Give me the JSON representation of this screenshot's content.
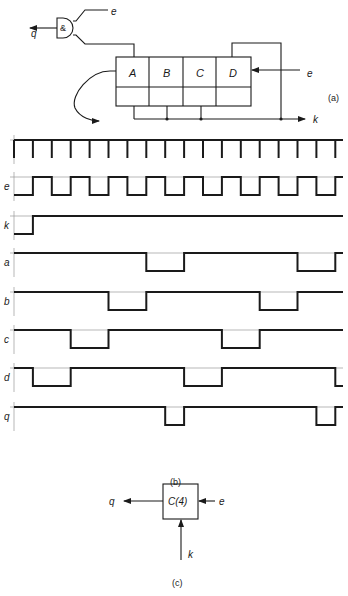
{
  "figure": {
    "panel_a": {
      "caption": "(a)",
      "gate_label": "&",
      "gate_output_label": "q",
      "gate_input_label": "e",
      "register_cells": [
        "A",
        "B",
        "C",
        "D"
      ],
      "clock_input_label": "e",
      "output_k_label": "k"
    },
    "panel_b": {
      "caption": "(b)",
      "num_clock_ticks": 18,
      "signals": [
        {
          "name": "clock",
          "label": "",
          "kind": "ticks"
        },
        {
          "name": "e",
          "label": "e",
          "transitions": [
            [
              0,
              0
            ],
            [
              1,
              1
            ],
            [
              2,
              0
            ],
            [
              3,
              1
            ],
            [
              4,
              0
            ],
            [
              5,
              1
            ],
            [
              6,
              0
            ],
            [
              7,
              1
            ],
            [
              8,
              0
            ],
            [
              9,
              1
            ],
            [
              10,
              0
            ],
            [
              11,
              1
            ],
            [
              12,
              0
            ],
            [
              13,
              1
            ],
            [
              14,
              0
            ],
            [
              15,
              1
            ],
            [
              16,
              0
            ],
            [
              17,
              1
            ]
          ]
        },
        {
          "name": "k",
          "label": "k",
          "transitions": [
            [
              0,
              0
            ],
            [
              1,
              1
            ]
          ]
        },
        {
          "name": "a",
          "label": "a",
          "transitions": [
            [
              0,
              1
            ],
            [
              7,
              0
            ],
            [
              9,
              1
            ],
            [
              15,
              0
            ],
            [
              17,
              1
            ]
          ]
        },
        {
          "name": "b",
          "label": "b",
          "transitions": [
            [
              0,
              1
            ],
            [
              5,
              0
            ],
            [
              7,
              1
            ],
            [
              13,
              0
            ],
            [
              15,
              1
            ]
          ]
        },
        {
          "name": "c",
          "label": "c",
          "transitions": [
            [
              0,
              1
            ],
            [
              3,
              0
            ],
            [
              5,
              1
            ],
            [
              11,
              0
            ],
            [
              13,
              1
            ]
          ]
        },
        {
          "name": "d",
          "label": "d",
          "transitions": [
            [
              0,
              1
            ],
            [
              1,
              0
            ],
            [
              3,
              1
            ],
            [
              9,
              0
            ],
            [
              11,
              1
            ],
            [
              17,
              0
            ]
          ]
        },
        {
          "name": "q",
          "label": "q",
          "transitions": [
            [
              0,
              1
            ],
            [
              8,
              0
            ],
            [
              9,
              1
            ],
            [
              16,
              0
            ],
            [
              17,
              1
            ]
          ]
        }
      ]
    },
    "panel_c": {
      "caption": "(c)",
      "block_label": "C(4)",
      "output_label": "q",
      "input_label": "e",
      "reset_label": "k"
    }
  }
}
